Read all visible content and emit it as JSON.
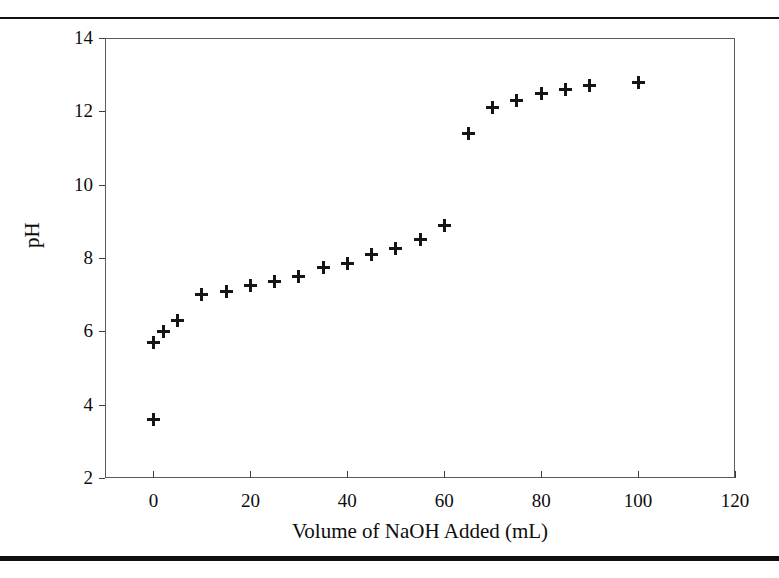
{
  "page": {
    "cropped_header_fragment": "",
    "top_rule": "divider-rule",
    "bottom_rule": "divider-rule"
  },
  "chart_data": {
    "type": "scatter",
    "title": "",
    "xlabel": "Volume of NaOH Added (mL)",
    "ylabel": "pH",
    "xlim": [
      -10,
      120
    ],
    "ylim": [
      2,
      14
    ],
    "xticks": [
      0,
      20,
      40,
      60,
      80,
      100,
      120
    ],
    "yticks": [
      2,
      4,
      6,
      8,
      10,
      12,
      14
    ],
    "xtick_labels": [
      "0",
      "20",
      "40",
      "60",
      "80",
      "100",
      "120"
    ],
    "ytick_labels": [
      "2",
      "4",
      "6",
      "8",
      "10",
      "12",
      "14"
    ],
    "grid": false,
    "legend": false,
    "marker": "plus",
    "marker_color": "#161616",
    "frame_color": "#5a5a5a",
    "x": [
      0,
      0,
      2,
      5,
      10,
      15,
      20,
      25,
      30,
      35,
      40,
      45,
      50,
      55,
      60,
      65,
      70,
      75,
      80,
      85,
      90,
      100
    ],
    "y": [
      3.6,
      5.7,
      6.0,
      6.3,
      7.0,
      7.1,
      7.25,
      7.35,
      7.5,
      7.75,
      7.85,
      8.1,
      8.25,
      8.5,
      8.9,
      11.4,
      12.1,
      12.3,
      12.5,
      12.6,
      12.7,
      12.8
    ],
    "points": [
      {
        "volume_mL": 0,
        "pH": 3.6
      },
      {
        "volume_mL": 0,
        "pH": 5.7
      },
      {
        "volume_mL": 2,
        "pH": 6.0
      },
      {
        "volume_mL": 5,
        "pH": 6.3
      },
      {
        "volume_mL": 10,
        "pH": 7.0
      },
      {
        "volume_mL": 15,
        "pH": 7.1
      },
      {
        "volume_mL": 20,
        "pH": 7.25
      },
      {
        "volume_mL": 25,
        "pH": 7.35
      },
      {
        "volume_mL": 30,
        "pH": 7.5
      },
      {
        "volume_mL": 35,
        "pH": 7.75
      },
      {
        "volume_mL": 40,
        "pH": 7.85
      },
      {
        "volume_mL": 45,
        "pH": 8.1
      },
      {
        "volume_mL": 50,
        "pH": 8.25
      },
      {
        "volume_mL": 55,
        "pH": 8.5
      },
      {
        "volume_mL": 60,
        "pH": 8.9
      },
      {
        "volume_mL": 65,
        "pH": 11.4
      },
      {
        "volume_mL": 70,
        "pH": 12.1
      },
      {
        "volume_mL": 75,
        "pH": 12.3
      },
      {
        "volume_mL": 80,
        "pH": 12.5
      },
      {
        "volume_mL": 85,
        "pH": 12.6
      },
      {
        "volume_mL": 90,
        "pH": 12.7
      },
      {
        "volume_mL": 100,
        "pH": 12.8
      }
    ]
  }
}
